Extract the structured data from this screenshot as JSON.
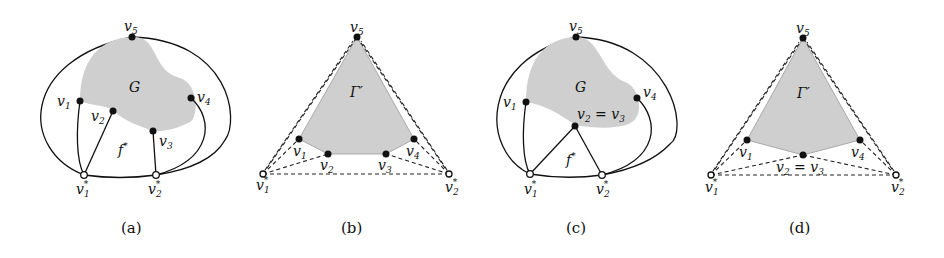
{
  "colors": {
    "region_fill": "#cfcfcf",
    "stroke": "#111111",
    "background": "#ffffff"
  },
  "panels": [
    {
      "caption": "(a)",
      "region_label": "G",
      "face_label": "f*",
      "vertices": [
        "v1",
        "v2",
        "v3",
        "v4",
        "v5"
      ],
      "outer_vertices": [
        "v1*",
        "v2*"
      ]
    },
    {
      "caption": "(b)",
      "region_label": "Γ′",
      "vertices": [
        "v1",
        "v2",
        "v3",
        "v4",
        "v5"
      ],
      "outer_vertices": [
        "v1*",
        "v2*"
      ]
    },
    {
      "caption": "(c)",
      "region_label": "G",
      "face_label": "f*",
      "vertices": [
        "v1",
        "v2 = v3",
        "v4",
        "v5"
      ],
      "outer_vertices": [
        "v1*",
        "v2*"
      ]
    },
    {
      "caption": "(d)",
      "region_label": "Γ′",
      "vertices": [
        "v1",
        "v2 = v3",
        "v4",
        "v5"
      ],
      "outer_vertices": [
        "v1*",
        "v2*"
      ]
    }
  ],
  "labels": {
    "v1": "v",
    "v2": "v",
    "v3": "v",
    "v4": "v",
    "v5": "v",
    "s1": "1",
    "s2": "2",
    "s3": "3",
    "s4": "4",
    "s5": "5",
    "star": "*",
    "eq": " = ",
    "G": "G",
    "Gamma": "Γ′",
    "f": "f",
    "fstar": "*",
    "cap_a": "(a)",
    "cap_b": "(b)",
    "cap_c": "(c)",
    "cap_d": "(d)"
  }
}
